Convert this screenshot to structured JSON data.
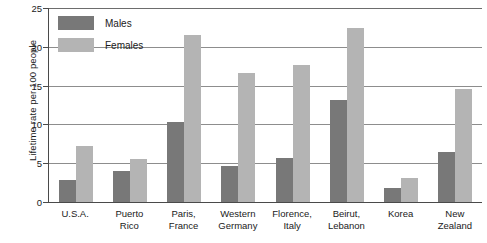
{
  "chart_data": {
    "type": "bar",
    "title": "",
    "xlabel": "",
    "ylabel": "Lifetime rate per 100 people",
    "ylim": [
      0,
      25
    ],
    "ytick_labels": [
      "0",
      "5",
      "10",
      "15",
      "20",
      "25"
    ],
    "ytick_values": [
      0,
      5,
      10,
      15,
      20,
      25
    ],
    "grid": true,
    "legend_position": "top-left",
    "categories": [
      "U.S.A.",
      "Puerto Rico",
      "Paris, France",
      "Western Germany",
      "Florence, Italy",
      "Beirut, Lebanon",
      "Korea",
      "New Zealand"
    ],
    "category_lines": [
      [
        "U.S.A.",
        ""
      ],
      [
        "Puerto",
        "Rico"
      ],
      [
        "Paris,",
        "France"
      ],
      [
        "Western",
        "Germany"
      ],
      [
        "Florence,",
        "Italy"
      ],
      [
        "Beirut,",
        "Lebanon"
      ],
      [
        "Korea",
        ""
      ],
      [
        "New",
        "Zealand"
      ]
    ],
    "series": [
      {
        "name": "Males",
        "color": "#787878",
        "values": [
          2.9,
          4.0,
          10.3,
          4.7,
          5.7,
          13.2,
          1.8,
          6.4
        ]
      },
      {
        "name": "Females",
        "color": "#b4b4b4",
        "values": [
          7.2,
          5.6,
          21.5,
          16.6,
          17.6,
          22.4,
          3.1,
          14.6
        ]
      }
    ]
  },
  "legend": {
    "items": [
      {
        "label": "Males",
        "color": "#787878"
      },
      {
        "label": "Females",
        "color": "#b4b4b4"
      }
    ]
  }
}
